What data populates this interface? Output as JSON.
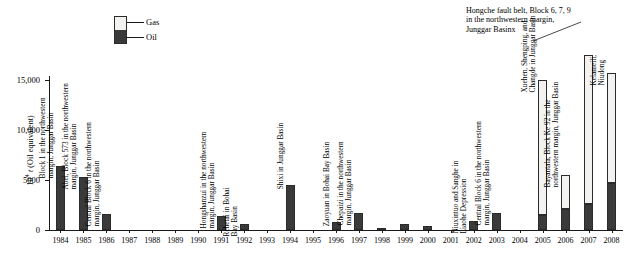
{
  "chart_data": {
    "type": "bar",
    "title": "",
    "xlabel": "",
    "ylabel": "10^4 t (Oil equivalent)",
    "ylabel_prefix": "10",
    "ylabel_sup": "4",
    "ylabel_suffix": " t (Oil equivalent)",
    "ylim": [
      0,
      17500
    ],
    "yticks": [
      0,
      5000,
      10000,
      15000
    ],
    "ytick_labels": [
      "0",
      "5000",
      "10,000",
      "15,000"
    ],
    "grid": false,
    "stacked": true,
    "legend_position": "top-left-center",
    "categories": [
      "1984",
      "1985",
      "1986",
      "1987",
      "1988",
      "1989",
      "1990",
      "1991",
      "1992",
      "1993",
      "1994",
      "1995",
      "1996",
      "1997",
      "1998",
      "1999",
      "2000",
      "2001",
      "2002",
      "2003",
      "2004",
      "2005",
      "2006",
      "2007",
      "2008"
    ],
    "series": [
      {
        "name": "Oil",
        "color": "#3a3a3a",
        "values": [
          6400,
          5300,
          1650,
          0,
          0,
          0,
          0,
          1450,
          620,
          0,
          4500,
          0,
          780,
          1750,
          200,
          560,
          420,
          0,
          900,
          1700,
          0,
          1500,
          2100,
          2600,
          4700
        ]
      },
      {
        "name": "Gas",
        "color": "#f2f2f0",
        "values": [
          0,
          0,
          0,
          0,
          0,
          0,
          0,
          0,
          0,
          0,
          0,
          0,
          0,
          0,
          0,
          0,
          0,
          0,
          0,
          0,
          0,
          13500,
          3400,
          14900,
          11000
        ]
      }
    ],
    "annotations": [
      {
        "category": "1984",
        "text": "Block 1 in the northwestern\nmargin, Junggar Basin"
      },
      {
        "category": "1985",
        "text": "Abei, Block 573 in the northwestern\nmargin, Junggar Basin"
      },
      {
        "category": "1986",
        "text": "Central Block 6 in the northwestern\nmargin, Junggar Basin"
      },
      {
        "category": "1991",
        "text": "Hongshanzui in the northwestern\nmargin, Junggar Basin"
      },
      {
        "category": "1992",
        "text": "Rehetai in Bohai\nBay Basin"
      },
      {
        "category": "1994",
        "text": "Shixi in Junggar Basin"
      },
      {
        "category": "1996",
        "text": "Zaoyuan in Bohai Bay Basin"
      },
      {
        "category": "1997",
        "text": "Chepaizi in the northwestern\nmargin, Junggar Basin"
      },
      {
        "category": "2002",
        "text": "Niuxintuo and Sanghe in\nLiaohe Depression"
      },
      {
        "category": "2003",
        "text": "Central Block 6 in the northwestern\nmargin, Junggar Basin"
      },
      {
        "category": "2005",
        "text": "Xuehen, Shengping, and\nChangde in Junggar Basin"
      },
      {
        "category": "2006",
        "text": "Bayantala, Block Ke 92 in the\nnorthwestern margin, Junggar Basin"
      },
      {
        "category": "2008",
        "text": "Kelameili,\nNiudong"
      }
    ],
    "callout": {
      "text": "Hongche fault belt, Block 6, 7, 9\nin the northwestern margin,\nJunggar Basinx",
      "points_to": "2007"
    }
  },
  "legend": {
    "items": [
      {
        "label": "Gas",
        "color": "#f2f2f0"
      },
      {
        "label": "Oil",
        "color": "#3a3a3a"
      }
    ]
  }
}
